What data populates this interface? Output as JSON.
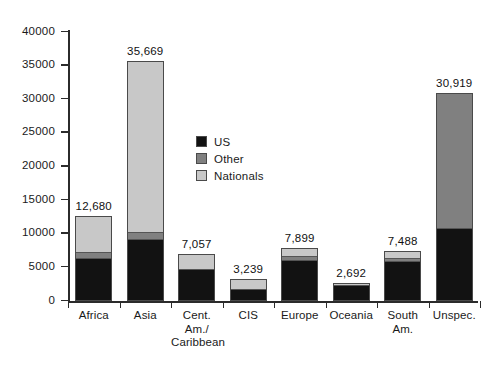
{
  "chart_data": {
    "type": "bar",
    "subtype": "stacked-vertical",
    "title": "",
    "xlabel": "",
    "ylabel": "",
    "ylim": [
      0,
      40000
    ],
    "grid": false,
    "legend_position": "inside-upper-center",
    "y_ticks": [
      0,
      5000,
      10000,
      15000,
      20000,
      25000,
      30000,
      35000,
      40000
    ],
    "y_tick_labels": [
      "0",
      "5000",
      "10000",
      "15000",
      "20000",
      "25000",
      "30000",
      "35000",
      "40000"
    ],
    "categories": [
      "Africa",
      "Asia",
      "Cent. Am./ Caribbean",
      "CIS",
      "Europe",
      "Oceania",
      "South Am.",
      "Unspec."
    ],
    "category_label_lines": [
      [
        "Africa"
      ],
      [
        "Asia"
      ],
      [
        "Cent.",
        "Am./",
        "Caribbean"
      ],
      [
        "CIS"
      ],
      [
        "Europe"
      ],
      [
        "Oceania"
      ],
      [
        "South",
        "Am."
      ],
      [
        "Unspec."
      ]
    ],
    "series": [
      {
        "name": "US",
        "color": "#121212",
        "values": [
          6200,
          9050,
          4600,
          1700,
          6100,
          2400,
          5900,
          10600
        ]
      },
      {
        "name": "Other",
        "color": "#808080",
        "values": [
          1000,
          1050,
          0,
          0,
          600,
          0,
          420,
          20319
        ]
      },
      {
        "name": "Nationals",
        "color": "#c8c8c8",
        "values": [
          5480,
          25569,
          2457,
          1539,
          1199,
          292,
          1168,
          0
        ]
      }
    ],
    "totals": [
      12680,
      35669,
      7057,
      3239,
      7899,
      2692,
      7488,
      30919
    ],
    "total_labels": [
      "12,680",
      "35,669",
      "7,057",
      "3,239",
      "7,899",
      "2,692",
      "7,488",
      "30,919"
    ]
  },
  "legend": {
    "items": [
      {
        "label": "US",
        "color": "#121212"
      },
      {
        "label": "Other",
        "color": "#808080"
      },
      {
        "label": "Nationals",
        "color": "#c8c8c8"
      }
    ]
  }
}
